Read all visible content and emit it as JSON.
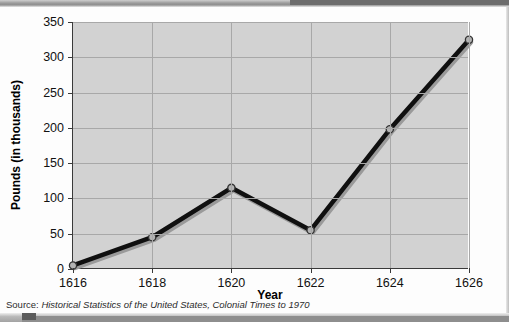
{
  "chart_data": {
    "type": "line",
    "title": "",
    "xlabel": "Year",
    "ylabel": "Pounds (in thousands)",
    "x": [
      1616,
      1618,
      1620,
      1622,
      1624,
      1626
    ],
    "categories": [
      "1616",
      "1618",
      "1620",
      "1622",
      "1624",
      "1626"
    ],
    "values": [
      5,
      45,
      115,
      55,
      198,
      325
    ],
    "series": [
      {
        "name": "Pounds (in thousands)",
        "values": [
          5,
          45,
          115,
          55,
          198,
          325
        ]
      }
    ],
    "xlim": [
      1616,
      1626
    ],
    "ylim": [
      0,
      350
    ],
    "y_ticks": [
      0,
      50,
      100,
      150,
      200,
      250,
      300,
      350
    ],
    "y_tick_labels": [
      "0",
      "50",
      "100",
      "150",
      "200",
      "250",
      "300",
      "350"
    ],
    "x_ticks": [
      1616,
      1618,
      1620,
      1622,
      1624,
      1626
    ],
    "x_tick_labels": [
      "1616",
      "1618",
      "1620",
      "1622",
      "1624",
      "1626"
    ],
    "grid": true,
    "legend": false,
    "legend_position": "none",
    "line_color": "#101010",
    "marker_color": "#b4b4b4",
    "marker_edge_color": "#333333",
    "plot_background": "#d2d2d2",
    "page_background": "#fdfdfd",
    "annotations": []
  },
  "source_note": {
    "lead": "Source: ",
    "text": "Historical Statistics of the United States, Colonial Times to 1970",
    "full": "Source: Historical Statistics of the United States, Colonial Times to 1970"
  }
}
